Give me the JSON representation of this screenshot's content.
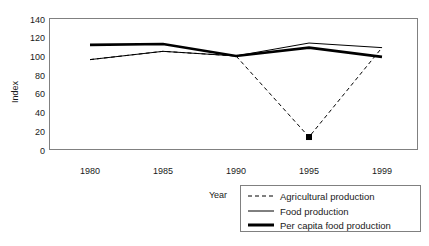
{
  "chart_data": {
    "type": "line",
    "title": "",
    "xlabel": "Year",
    "ylabel": "Index",
    "categories": [
      "1980",
      "1985",
      "1990",
      "1995",
      "1999"
    ],
    "ylim": [
      0,
      140
    ],
    "yticks": [
      "0",
      "20",
      "40",
      "60",
      "80",
      "100",
      "120",
      "140"
    ],
    "grid": false,
    "legend_position": "bottom-right",
    "series": [
      {
        "name": "Agricultural production",
        "style": "dashed",
        "width": "thin",
        "color": "#000000",
        "values": [
          97,
          106,
          101,
          13,
          110
        ],
        "markers": [
          false,
          false,
          false,
          true,
          false
        ]
      },
      {
        "name": "Food production",
        "style": "solid",
        "width": "thin",
        "color": "#000000",
        "values": [
          97,
          106,
          101,
          115,
          110
        ],
        "markers": [
          false,
          false,
          false,
          false,
          false
        ]
      },
      {
        "name": "Per capita food production",
        "style": "solid",
        "width": "thick",
        "color": "#000000",
        "values": [
          113,
          114,
          101,
          110,
          100
        ],
        "markers": [
          false,
          false,
          false,
          false,
          false
        ]
      }
    ]
  },
  "axes": {
    "y_title": "Index",
    "x_title": "Year"
  },
  "legend": {
    "items": [
      {
        "label": "Agricultural production"
      },
      {
        "label": "Food production"
      },
      {
        "label": "Per capita food production"
      }
    ]
  }
}
